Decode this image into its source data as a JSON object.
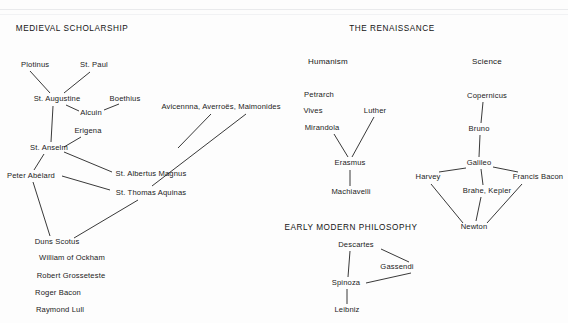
{
  "diagram": {
    "type": "intellectual-history-network",
    "sections": [
      {
        "id": "medieval",
        "title": "MEDIEVAL SCHOLARSHIP",
        "x": 72,
        "y": 29
      },
      {
        "id": "renaissance",
        "title": "THE RENAISSANCE",
        "x": 392,
        "y": 29
      },
      {
        "id": "earlymodern",
        "title": "EARLY MODERN PHILOSOPHY",
        "x": 351,
        "y": 228
      }
    ],
    "group_labels": [
      {
        "id": "humanism",
        "label": "Humanism",
        "x": 328,
        "y": 62
      },
      {
        "id": "science",
        "label": "Science",
        "x": 487,
        "y": 62
      }
    ],
    "nodes": [
      {
        "id": "plotinus",
        "label": "Plotinus",
        "x": 21,
        "y": 65,
        "anchor": "left"
      },
      {
        "id": "stpaul",
        "label": "St. Paul",
        "x": 94,
        "y": 65,
        "anchor": "center"
      },
      {
        "id": "staugustine",
        "label": "St. Augustine",
        "x": 57,
        "y": 99,
        "anchor": "center"
      },
      {
        "id": "boethius",
        "label": "Boethius",
        "x": 125,
        "y": 99,
        "anchor": "center"
      },
      {
        "id": "alcuin",
        "label": "Alcuin",
        "x": 91,
        "y": 113,
        "anchor": "center"
      },
      {
        "id": "erigena",
        "label": "Erigena",
        "x": 88,
        "y": 131,
        "anchor": "center"
      },
      {
        "id": "stanselm",
        "label": "St. Anselm",
        "x": 49,
        "y": 148,
        "anchor": "center"
      },
      {
        "id": "avicenna",
        "label": "Avicennna, Averroës, Maimonides",
        "x": 221,
        "y": 107,
        "anchor": "center"
      },
      {
        "id": "peterabelard",
        "label": "Peter Abélard",
        "x": 31,
        "y": 176,
        "anchor": "center"
      },
      {
        "id": "albertusmagnus",
        "label": "St. Albertus Magnus",
        "x": 151,
        "y": 174,
        "anchor": "center"
      },
      {
        "id": "thomasaquinas",
        "label": "St. Thomas Aquinas",
        "x": 151,
        "y": 193,
        "anchor": "center"
      },
      {
        "id": "dunsscotus",
        "label": "Duns Scotus",
        "x": 57,
        "y": 242,
        "anchor": "center"
      },
      {
        "id": "williamockham",
        "label": "William of Ockham",
        "x": 72,
        "y": 258,
        "anchor": "center"
      },
      {
        "id": "grosseteste",
        "label": "Robert Grosseteste",
        "x": 71,
        "y": 276,
        "anchor": "center"
      },
      {
        "id": "rogerbacon",
        "label": "Roger Bacon",
        "x": 58,
        "y": 293,
        "anchor": "center"
      },
      {
        "id": "raymondlull",
        "label": "Raymond Lull",
        "x": 60,
        "y": 310,
        "anchor": "center"
      },
      {
        "id": "petrarch",
        "label": "Petrarch",
        "x": 319,
        "y": 95,
        "anchor": "center"
      },
      {
        "id": "vives",
        "label": "Vives",
        "x": 313,
        "y": 111,
        "anchor": "center"
      },
      {
        "id": "mirandola",
        "label": "Mirandola",
        "x": 322,
        "y": 128,
        "anchor": "center"
      },
      {
        "id": "luther",
        "label": "Luther",
        "x": 375,
        "y": 111,
        "anchor": "center"
      },
      {
        "id": "erasmus",
        "label": "Erasmus",
        "x": 350,
        "y": 163,
        "anchor": "center"
      },
      {
        "id": "machiavelli",
        "label": "Machiavelli",
        "x": 351,
        "y": 192,
        "anchor": "center"
      },
      {
        "id": "copernicus",
        "label": "Copernicus",
        "x": 487,
        "y": 96,
        "anchor": "center"
      },
      {
        "id": "bruno",
        "label": "Bruno",
        "x": 479,
        "y": 129,
        "anchor": "center"
      },
      {
        "id": "galileo",
        "label": "Galileo",
        "x": 479,
        "y": 163,
        "anchor": "center"
      },
      {
        "id": "harvey",
        "label": "Harvey",
        "x": 428,
        "y": 177,
        "anchor": "center"
      },
      {
        "id": "francisbacon",
        "label": "Francis Bacon",
        "x": 538,
        "y": 177,
        "anchor": "center"
      },
      {
        "id": "brahekepler",
        "label": "Brahe, Kepler",
        "x": 487,
        "y": 191,
        "anchor": "center"
      },
      {
        "id": "newton",
        "label": "Newton",
        "x": 474,
        "y": 227,
        "anchor": "center"
      },
      {
        "id": "descartes",
        "label": "Descartes",
        "x": 356,
        "y": 245,
        "anchor": "center"
      },
      {
        "id": "gassendi",
        "label": "Gassendi",
        "x": 397,
        "y": 267,
        "anchor": "center"
      },
      {
        "id": "spinoza",
        "label": "Spinoza",
        "x": 346,
        "y": 283,
        "anchor": "center"
      },
      {
        "id": "leibniz",
        "label": "Leibniz",
        "x": 347,
        "y": 310,
        "anchor": "center"
      }
    ],
    "edges": [
      {
        "from": "plotinus",
        "to": "staugustine",
        "x1": 30,
        "y1": 71,
        "x2": 50,
        "y2": 93
      },
      {
        "from": "stpaul",
        "to": "staugustine",
        "x1": 90,
        "y1": 72,
        "x2": 64,
        "y2": 93
      },
      {
        "from": "staugustine",
        "to": "alcuin",
        "x1": 66,
        "y1": 105,
        "x2": 79,
        "y2": 111
      },
      {
        "from": "alcuin",
        "to": "boethius",
        "x1": 104,
        "y1": 110,
        "x2": 119,
        "y2": 104
      },
      {
        "from": "staugustine",
        "to": "stanselm",
        "x1": 53,
        "y1": 106,
        "x2": 51,
        "y2": 142
      },
      {
        "from": "erigena",
        "to": "stanselm",
        "x1": 81,
        "y1": 137,
        "x2": 64,
        "y2": 147
      },
      {
        "from": "stanselm",
        "to": "peterabelard",
        "x1": 44,
        "y1": 154,
        "x2": 34,
        "y2": 170
      },
      {
        "from": "stanselm",
        "to": "albertusmagnus",
        "x1": 64,
        "y1": 152,
        "x2": 112,
        "y2": 172
      },
      {
        "from": "peterabelard",
        "to": "thomasaquinas",
        "x1": 62,
        "y1": 176,
        "x2": 110,
        "y2": 190
      },
      {
        "from": "avicenna",
        "to": "albertusmagnus",
        "x1": 211,
        "y1": 114,
        "x2": 178,
        "y2": 148
      },
      {
        "from": "avicenna",
        "to": "thomasaquinas",
        "x1": 246,
        "y1": 114,
        "x2": 152,
        "y2": 186
      },
      {
        "from": "peterabelard",
        "to": "dunsscotus",
        "x1": 33,
        "y1": 182,
        "x2": 50,
        "y2": 236
      },
      {
        "from": "thomasaquinas",
        "to": "dunsscotus",
        "x1": 138,
        "y1": 200,
        "x2": 74,
        "y2": 238
      },
      {
        "from": "mirandola",
        "to": "erasmus",
        "x1": 334,
        "y1": 134,
        "x2": 348,
        "y2": 157
      },
      {
        "from": "luther",
        "to": "erasmus",
        "x1": 374,
        "y1": 117,
        "x2": 352,
        "y2": 157
      },
      {
        "from": "erasmus",
        "to": "machiavelli",
        "x1": 350,
        "y1": 170,
        "x2": 350,
        "y2": 186
      },
      {
        "from": "copernicus",
        "to": "bruno",
        "x1": 483,
        "y1": 102,
        "x2": 481,
        "y2": 123
      },
      {
        "from": "bruno",
        "to": "galileo",
        "x1": 480,
        "y1": 135,
        "x2": 479,
        "y2": 157
      },
      {
        "from": "galileo",
        "to": "harvey",
        "x1": 466,
        "y1": 168,
        "x2": 439,
        "y2": 172
      },
      {
        "from": "galileo",
        "to": "francisbacon",
        "x1": 493,
        "y1": 167,
        "x2": 518,
        "y2": 172
      },
      {
        "from": "galileo",
        "to": "brahekepler",
        "x1": 481,
        "y1": 169,
        "x2": 483,
        "y2": 185
      },
      {
        "from": "brahekepler",
        "to": "newton",
        "x1": 481,
        "y1": 197,
        "x2": 476,
        "y2": 221
      },
      {
        "from": "harvey",
        "to": "newton",
        "x1": 431,
        "y1": 184,
        "x2": 463,
        "y2": 223
      },
      {
        "from": "francisbacon",
        "to": "newton",
        "x1": 522,
        "y1": 184,
        "x2": 487,
        "y2": 223
      },
      {
        "from": "descartes",
        "to": "gassendi",
        "x1": 381,
        "y1": 249,
        "x2": 409,
        "y2": 262
      },
      {
        "from": "descartes",
        "to": "spinoza",
        "x1": 350,
        "y1": 251,
        "x2": 348,
        "y2": 277
      },
      {
        "from": "gassendi",
        "to": "spinoza",
        "x1": 411,
        "y1": 273,
        "x2": 366,
        "y2": 283
      },
      {
        "from": "spinoza",
        "to": "leibniz",
        "x1": 347,
        "y1": 289,
        "x2": 347,
        "y2": 304
      }
    ]
  }
}
